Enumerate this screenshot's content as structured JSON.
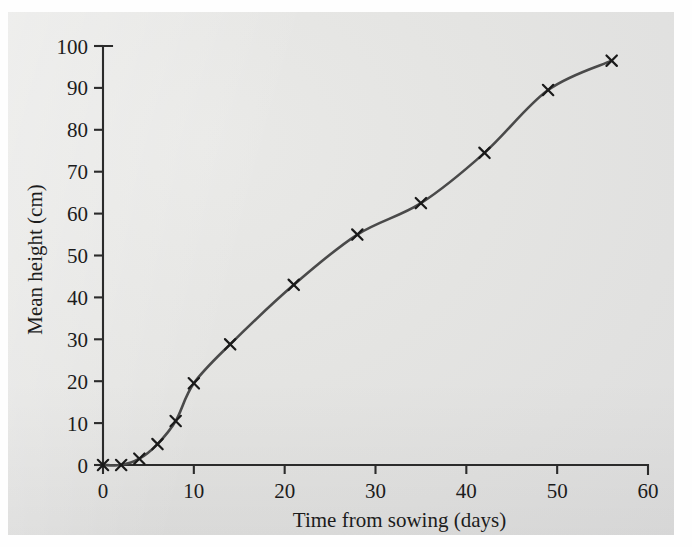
{
  "figure": {
    "background_color": "#e4e4e2",
    "curve_color": "#4a4a4a",
    "axis_color": "#2b2b2b",
    "marker_color": "#1a1a1a",
    "marker_symbol": "x-cross"
  },
  "chart_data": {
    "type": "line",
    "title": "",
    "subtitle": "",
    "xlabel": "Time from sowing (days)",
    "ylabel": "Mean height (cm)",
    "xlim": [
      0,
      60
    ],
    "ylim": [
      0,
      100
    ],
    "xticks": [
      0,
      10,
      20,
      30,
      40,
      50,
      60
    ],
    "yticks": [
      0,
      10,
      20,
      30,
      40,
      50,
      60,
      70,
      80,
      90,
      100
    ],
    "xtick_labels": [
      "0",
      "10",
      "20",
      "30",
      "40",
      "50",
      "60"
    ],
    "ytick_labels": [
      "0",
      "10",
      "20",
      "30",
      "40",
      "50",
      "60",
      "70",
      "80",
      "90",
      "100"
    ],
    "grid": false,
    "legend": null,
    "legend_position": "none",
    "annotations": [],
    "series": [
      {
        "name": "Mean height",
        "marker": "x",
        "x": [
          0,
          2,
          4,
          6,
          8,
          10,
          14,
          21,
          28,
          35,
          42,
          49,
          56
        ],
        "y": [
          0,
          0,
          1.5,
          5,
          10.5,
          19.5,
          28.8,
          43,
          55,
          62.5,
          74.5,
          89.5,
          96.5
        ]
      }
    ]
  }
}
